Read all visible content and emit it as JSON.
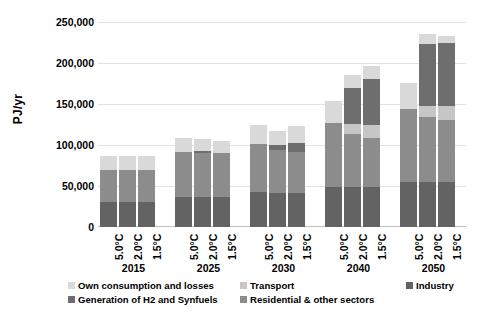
{
  "chart_data": {
    "type": "bar",
    "stacked": true,
    "title": "",
    "xlabel": "",
    "ylabel": "PJ/yr",
    "ylim": [
      0,
      250000
    ],
    "ytick_labels": [
      "0",
      "50,000",
      "100,000",
      "150,000",
      "200,000",
      "250,000"
    ],
    "ytick_values": [
      0,
      50000,
      100000,
      150000,
      200000,
      250000
    ],
    "grid": true,
    "legend_position": "bottom",
    "group_labels": [
      "2015",
      "2025",
      "2030",
      "2040",
      "2050"
    ],
    "scenario_labels": [
      "5.0°C",
      "2.0°C",
      "1.5°C"
    ],
    "categories": [
      "2015 5.0°C",
      "2015 2.0°C",
      "2015 1.5°C",
      "2025 5.0°C",
      "2025 2.0°C",
      "2025 1.5°C",
      "2030 5.0°C",
      "2030 2.0°C",
      "2030 1.5°C",
      "2040 5.0°C",
      "2040 2.0°C",
      "2040 1.5°C",
      "2050 5.0°C",
      "2050 2.0°C",
      "2050 1.5°C"
    ],
    "series": [
      {
        "name": "Industry",
        "color": "#636363",
        "values": [
          31000,
          31000,
          31000,
          37000,
          37000,
          37000,
          43000,
          42000,
          42000,
          49000,
          49000,
          49000,
          55000,
          55000,
          55000
        ]
      },
      {
        "name": "Residential & other sectors",
        "color": "#8c8c8c",
        "values": [
          38000,
          38000,
          38000,
          55000,
          53000,
          53000,
          58000,
          52000,
          49000,
          78000,
          65000,
          59000,
          89000,
          79000,
          76000
        ]
      },
      {
        "name": "Transport",
        "color": "#c6c6c6",
        "values": [
          0,
          0,
          0,
          0,
          0,
          0,
          0,
          0,
          0,
          0,
          12000,
          16000,
          0,
          13000,
          16000
        ]
      },
      {
        "name": "Generation of H2 and Synfuels",
        "color": "#6e6e6e",
        "values": [
          0,
          0,
          0,
          0,
          3000,
          0,
          0,
          6000,
          11000,
          0,
          44000,
          56000,
          0,
          76000,
          77000
        ]
      },
      {
        "name": "Own consumption and losses",
        "color": "#d9d9d9",
        "values": [
          18000,
          18000,
          18000,
          16000,
          14000,
          15000,
          24000,
          17000,
          21000,
          27000,
          15000,
          16000,
          32000,
          12000,
          9000
        ]
      }
    ],
    "totals": [
      87000,
      87000,
      87000,
      108000,
      107000,
      105000,
      125000,
      117000,
      123000,
      154000,
      185000,
      196000,
      176000,
      235000,
      233000
    ]
  },
  "legend": {
    "items": [
      {
        "label": "Own consumption and losses",
        "color": "#d9d9d9"
      },
      {
        "label": "Transport",
        "color": "#c6c6c6"
      },
      {
        "label": "Industry",
        "color": "#636363"
      },
      {
        "label": "Generation of H2 and Synfuels",
        "color": "#6e6e6e"
      },
      {
        "label": "Residential & other sectors",
        "color": "#8c8c8c"
      }
    ]
  }
}
